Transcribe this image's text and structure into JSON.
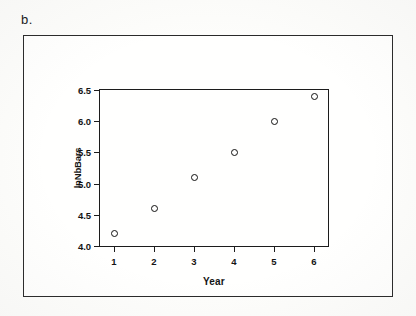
{
  "figure": {
    "panel_label": "b.",
    "border_color": "#2a2a2a",
    "ink_color": "#141414",
    "background_color": "#fffffe"
  },
  "chart_data": {
    "type": "scatter",
    "title": "",
    "xlabel": "Year",
    "ylabel": "lnNbBars",
    "x": [
      1,
      2,
      3,
      4,
      5,
      6
    ],
    "values": [
      4.2,
      4.6,
      5.1,
      5.5,
      6.0,
      6.4
    ],
    "series": [
      {
        "name": "lnNbBars",
        "values": [
          4.2,
          4.6,
          5.1,
          5.5,
          6.0,
          6.4
        ],
        "marker": "open-circle",
        "marker_color": "#111111"
      }
    ],
    "xlim": [
      0.65,
      6.35
    ],
    "ylim": [
      4.0,
      6.5
    ],
    "xticks": [
      1,
      2,
      3,
      4,
      5,
      6
    ],
    "xtick_labels": [
      "1",
      "2",
      "3",
      "4",
      "5",
      "6"
    ],
    "yticks": [
      4.0,
      4.5,
      5.0,
      5.5,
      6.0,
      6.5
    ],
    "ytick_labels": [
      "4.0",
      "4.5",
      "5.0",
      "5.5",
      "6.0",
      "6.5"
    ],
    "grid": false,
    "legend": false,
    "legend_position": "none",
    "tick_direction": "out",
    "frame": "box",
    "annotations": []
  }
}
